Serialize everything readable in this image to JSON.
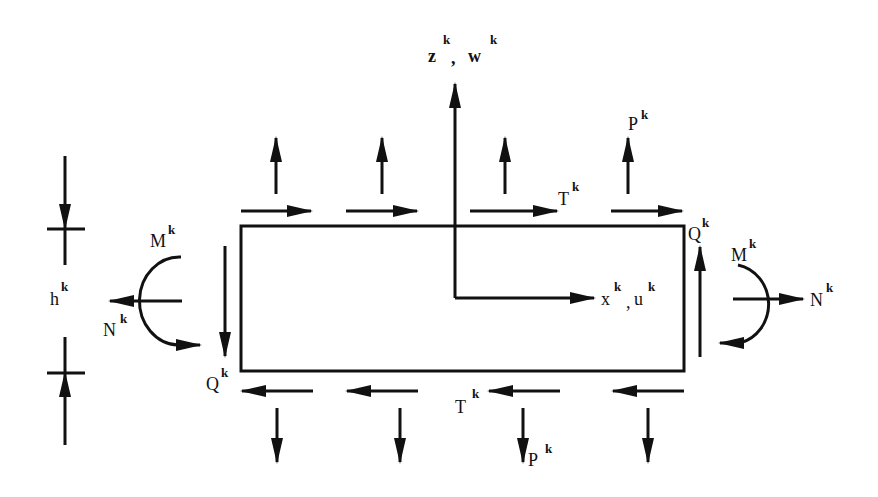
{
  "diagram": {
    "labels": {
      "z_axis": {
        "base": "z",
        "sup": "k"
      },
      "w_disp": {
        "base": "w",
        "sup": "k"
      },
      "axis_comma_z": ",",
      "x_axis": {
        "base": "x",
        "sup": "k"
      },
      "u_disp": {
        "base": "u",
        "sup": "k"
      },
      "axis_comma_x": ",",
      "P_top": {
        "base": "P",
        "sup": "k"
      },
      "P_bottom": {
        "base": "P",
        "sup": "k"
      },
      "T_top": {
        "base": "T",
        "sup": "k"
      },
      "T_bottom": {
        "base": "T",
        "sup": "k"
      },
      "Q_right": {
        "base": "Q",
        "sup": "k"
      },
      "Q_left": {
        "base": "Q",
        "sup": "k"
      },
      "M_left": {
        "base": "M",
        "sup": "k"
      },
      "M_right": {
        "base": "M",
        "sup": "k"
      },
      "N_left": {
        "base": "N",
        "sup": "k"
      },
      "N_right": {
        "base": "N",
        "sup": "k"
      },
      "h_thickness": {
        "base": "h",
        "sup": "k"
      }
    },
    "colors": {
      "stroke": "#111111",
      "background": "#ffffff"
    }
  }
}
